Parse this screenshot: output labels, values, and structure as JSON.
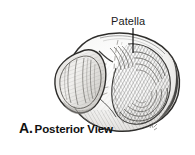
{
  "figure": {
    "title_alt": "Patella, posterior view anatomical illustration",
    "background_color": "#ffffff",
    "ink_color": "#1b1b1b"
  },
  "labels": [
    {
      "id": "patella",
      "text": "Patella",
      "leader_line": true
    }
  ],
  "caption": {
    "letter": "A.",
    "text": "Posterior View"
  },
  "illustration": {
    "subject": "patella-bone",
    "view": "posterior",
    "features": [
      "lateral-facet",
      "medial-facet",
      "vertical-ridge",
      "apex",
      "articular-surface-hatching"
    ],
    "artist_initials": "K.F."
  }
}
